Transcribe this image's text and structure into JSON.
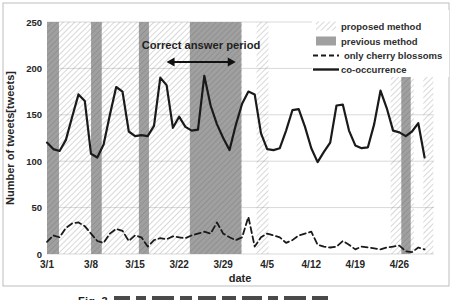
{
  "figure": {
    "caption_prefix": "Fig. 3",
    "border_color": "#bdbdbd"
  },
  "chart_data": {
    "type": "line",
    "title": "",
    "xlabel": "date",
    "ylabel": "Number of tweets[tweets]",
    "ylim": [
      0,
      250
    ],
    "y_ticks": [
      0,
      50,
      100,
      150,
      200,
      250
    ],
    "xlim_days": [
      0,
      61.5
    ],
    "x_start": "3/1",
    "x_end": "4/30",
    "x_step": "1 day",
    "grid": "horizontal",
    "x_ticks": [
      {
        "day": 0,
        "label": "3/1"
      },
      {
        "day": 7,
        "label": "3/8"
      },
      {
        "day": 14,
        "label": "3/15"
      },
      {
        "day": 21,
        "label": "3/22"
      },
      {
        "day": 28,
        "label": "3/29"
      },
      {
        "day": 35,
        "label": "4/5"
      },
      {
        "day": 42,
        "label": "4/12"
      },
      {
        "day": 49,
        "label": "4/19"
      },
      {
        "day": 56,
        "label": "4/26"
      }
    ],
    "series": [
      {
        "name": "only cherry blossoms",
        "style": "dashed",
        "color": "#1a1a1a",
        "values": [
          13,
          20,
          18,
          28,
          33,
          34,
          30,
          22,
          14,
          12,
          22,
          27,
          25,
          14,
          20,
          18,
          8,
          15,
          17,
          16,
          19,
          18,
          17,
          20,
          22,
          24,
          22,
          34,
          22,
          18,
          15,
          18,
          40,
          8,
          18,
          22,
          20,
          18,
          12,
          15,
          20,
          22,
          24,
          10,
          8,
          7,
          8,
          14,
          10,
          5,
          8,
          7,
          6,
          5,
          7,
          8,
          9,
          3,
          2,
          7,
          5
        ]
      },
      {
        "name": "co-occurrence",
        "style": "solid",
        "color": "#1a1a1a",
        "values": [
          120,
          113,
          111,
          123,
          148,
          172,
          165,
          108,
          104,
          118,
          150,
          180,
          175,
          132,
          127,
          128,
          127,
          138,
          190,
          182,
          136,
          148,
          137,
          133,
          134,
          192,
          160,
          140,
          125,
          112,
          139,
          162,
          175,
          172,
          130,
          113,
          112,
          114,
          133,
          155,
          156,
          137,
          114,
          99,
          110,
          120,
          160,
          161,
          133,
          117,
          114,
          115,
          140,
          176,
          157,
          133,
          131,
          127,
          132,
          141,
          104
        ]
      }
    ],
    "regions": {
      "proposed_method": {
        "swatch": "hatch",
        "spans_days": [
          [
            0,
            31
          ],
          [
            33.3,
            35.2
          ],
          [
            54.6,
            58.3
          ],
          [
            59.8,
            61.4
          ]
        ]
      },
      "previous_method": {
        "color": "#a0a0a0",
        "spans_days": [
          [
            0,
            1.9
          ],
          [
            7,
            8.7
          ],
          [
            14.6,
            16.2
          ],
          [
            22.7,
            30.9
          ],
          [
            56.3,
            57.8
          ]
        ]
      }
    },
    "annotation": {
      "text": "Correct answer period",
      "span_days": [
        19,
        30
      ]
    },
    "legend": {
      "position": "top-right",
      "items": [
        {
          "label": "proposed method",
          "swatch": "hatch"
        },
        {
          "label": "previous method",
          "swatch": "gray-fill"
        },
        {
          "label": "only cherry blossoms",
          "swatch": "dashed-line"
        },
        {
          "label": "co-occurrence",
          "swatch": "solid-line"
        }
      ]
    },
    "colors": {
      "line": "#1a1a1a",
      "previous_method_fill": "#a0a0a0",
      "hatch_line": "#5f5f5f",
      "gridline": "#d9d9d9",
      "text": "#262626"
    }
  }
}
